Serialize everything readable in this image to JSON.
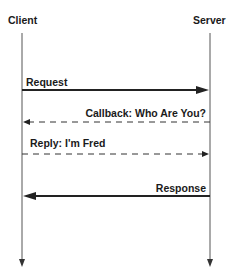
{
  "diagram": {
    "type": "sequence",
    "participants": [
      {
        "id": "client",
        "label": "Client",
        "x": 22
      },
      {
        "id": "server",
        "label": "Server",
        "x": 210
      }
    ],
    "messages": [
      {
        "label": "Request",
        "from": "client",
        "to": "server",
        "style": "solid",
        "y": 90
      },
      {
        "label": "Callback: Who Are You?",
        "from": "server",
        "to": "client",
        "style": "dashed",
        "y": 122
      },
      {
        "label": "Reply: I'm Fred",
        "from": "client",
        "to": "server",
        "style": "dashed",
        "y": 154
      },
      {
        "label": "Response",
        "from": "server",
        "to": "client",
        "style": "solid",
        "y": 196
      }
    ],
    "colors": {
      "line": "#222222",
      "lifeline": "#555555",
      "text": "#1a1a1a",
      "background": "#ffffff"
    }
  }
}
